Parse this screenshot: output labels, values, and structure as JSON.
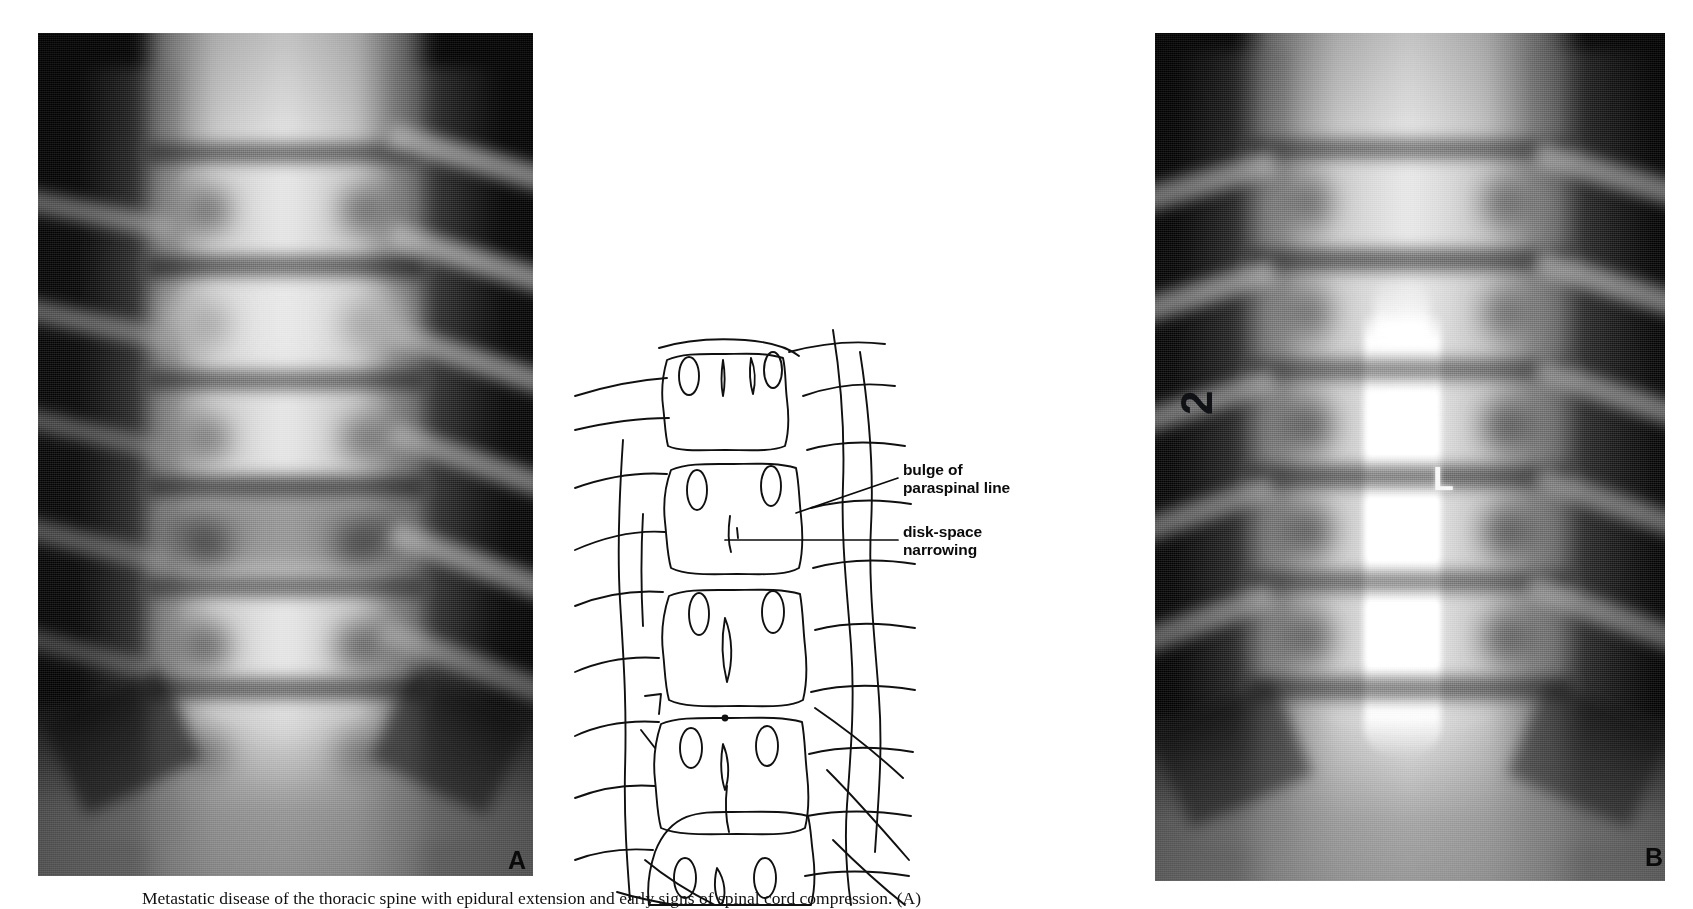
{
  "figure": {
    "caption": "Metastatic disease of the thoracic spine with epidural extension and early signs of spinal cord compression. (A)",
    "background_color": "#ffffff",
    "ink_color": "#0b0b0b"
  },
  "panels": [
    {
      "id": "panel-a",
      "letter": "A",
      "kind": "radiograph",
      "modality": "AP thoracic spine radiograph",
      "film_markers": []
    },
    {
      "id": "panel-b",
      "letter": "B",
      "kind": "radiograph",
      "modality": "AP thoracic myelogram",
      "film_markers": [
        {
          "name": "side-marker-left",
          "text": "2",
          "color": "#15161a"
        },
        {
          "name": "side-marker-right",
          "text": "L",
          "color": "#f2f2f2"
        }
      ]
    }
  ],
  "diagram": {
    "id": "panel-diagram",
    "kind": "line-drawing",
    "vertebra_count": 6
  },
  "annotations": [
    {
      "id": "annotation-bulge",
      "text": "bulge of\nparaspinal line",
      "target": "right paraspinal line",
      "leader": {
        "x1": 898,
        "y1": 478,
        "x2": 800,
        "y2": 512
      }
    },
    {
      "id": "annotation-disk",
      "text": "disk-space\nnarrowing",
      "target": "intervertebral disk space",
      "leader": {
        "x1": 898,
        "y1": 540,
        "x2": 708,
        "y2": 540
      }
    }
  ]
}
